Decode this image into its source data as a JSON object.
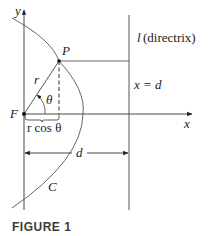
{
  "figure": {
    "caption": "FIGURE 1",
    "labels": {
      "y_axis": "y",
      "x_axis": "x",
      "focus": "F",
      "point": "P",
      "radius": "r",
      "angle": "θ",
      "projection": "r cos θ",
      "distance": "d",
      "curve": "C",
      "directrix_name": "l",
      "directrix_desc": "(directrix)",
      "directrix_eq": "x = d"
    }
  }
}
